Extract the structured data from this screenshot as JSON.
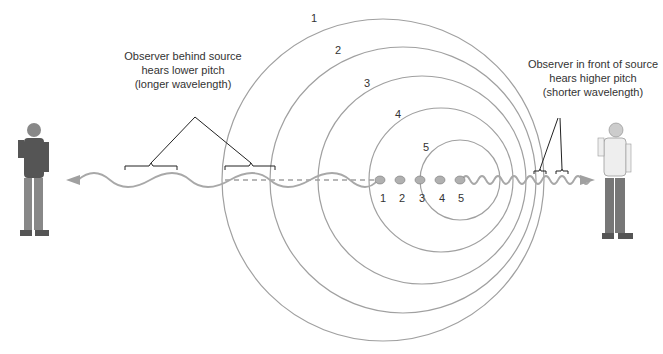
{
  "left_observer": {
    "caption_lines": [
      "Observer behind source",
      "hears lower pitch",
      "(longer wavelength)"
    ]
  },
  "right_observer": {
    "caption_lines": [
      "Observer in front of source",
      "hears higher pitch",
      "(shorter wavelength)"
    ]
  },
  "wavefronts": {
    "labels": [
      "1",
      "2",
      "3",
      "4",
      "5"
    ]
  },
  "source_positions": {
    "labels": [
      "1",
      "2",
      "3",
      "4",
      "5"
    ]
  },
  "colors": {
    "circle": "#9a9a9a",
    "wave": "#9a9a9a",
    "text": "#333333"
  }
}
